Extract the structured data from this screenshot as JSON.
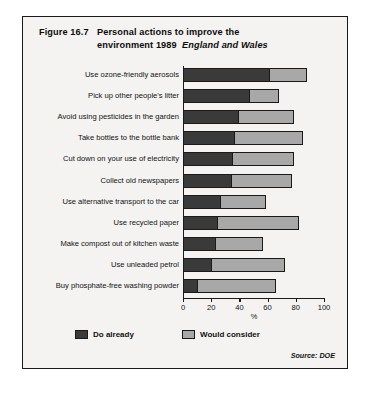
{
  "figure": {
    "number": "Figure 16.7",
    "title_line1": "Personal actions to improve the",
    "title_line2": "environment 1989",
    "title_region": "England and Wales",
    "source": "Source: DOE"
  },
  "legend": {
    "series1_label": "Do already",
    "series2_label": "Would consider",
    "series1_color": "#3a3a3a",
    "series2_color": "#a8a8a8"
  },
  "axis": {
    "xlabel": "%",
    "ticks": [
      "0",
      "20",
      "40",
      "60",
      "80",
      "100"
    ]
  },
  "chart_data": {
    "type": "bar",
    "orientation": "horizontal",
    "stacked": true,
    "subtitle": "England and Wales",
    "xlabel": "%",
    "ylabel": "",
    "xlim": [
      0,
      100
    ],
    "xticks": [
      0,
      20,
      40,
      60,
      80,
      100
    ],
    "grid": false,
    "legend_position": "bottom",
    "source": "Source: DOE",
    "categories": [
      "Use ozone-friendly aerosols",
      "Pick up other people's litter",
      "Avoid using pesticides in the garden",
      "Take bottles to the bottle bank",
      "Cut down on your use of electricity",
      "Collect old newspapers",
      "Use alternative transport to the car",
      "Use recycled paper",
      "Make compost out of kitchen waste",
      "Use unleaded petrol",
      "Buy phosphate-free washing powder"
    ],
    "series": [
      {
        "name": "Do already",
        "color": "#3a3a3a",
        "values": [
          61,
          47,
          39,
          36,
          35,
          34,
          26,
          24,
          23,
          20,
          10
        ]
      },
      {
        "name": "Would consider",
        "color": "#a8a8a8",
        "values": [
          27,
          21,
          40,
          49,
          44,
          43,
          33,
          58,
          34,
          52,
          56
        ]
      }
    ],
    "totals": [
      88,
      68,
      79,
      85,
      79,
      77,
      59,
      82,
      57,
      72,
      66
    ]
  }
}
